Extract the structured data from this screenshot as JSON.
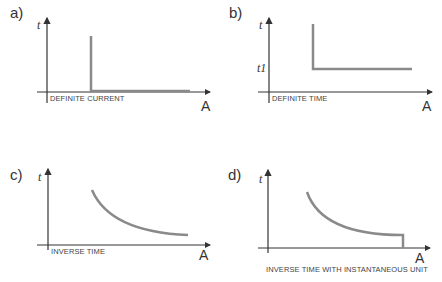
{
  "colors": {
    "axis": "#333333",
    "curve": "#8a8a8a"
  },
  "panels": [
    {
      "label": "a)",
      "y_axis": "t",
      "x_axis": "A",
      "caption": "DEFINITE CURRENT"
    },
    {
      "label": "b)",
      "y_axis": "t",
      "x_axis": "A",
      "caption": "DEFINITE TIME",
      "tick": "t1"
    },
    {
      "label": "c)",
      "y_axis": "t",
      "x_axis": "A",
      "caption": "INVERSE TIME"
    },
    {
      "label": "d)",
      "y_axis": "t",
      "x_axis": "A",
      "caption": "INVERSE TIME WITH INSTANTANEOUS UNIT"
    }
  ]
}
